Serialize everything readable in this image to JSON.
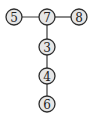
{
  "diagram": {
    "type": "tree",
    "nodes": [
      {
        "id": "5",
        "label": "5",
        "x": 14,
        "y": 17
      },
      {
        "id": "7",
        "label": "7",
        "x": 47,
        "y": 17
      },
      {
        "id": "8",
        "label": "8",
        "x": 79,
        "y": 17
      },
      {
        "id": "3",
        "label": "3",
        "x": 47,
        "y": 47
      },
      {
        "id": "4",
        "label": "4",
        "x": 47,
        "y": 76
      },
      {
        "id": "6",
        "label": "6",
        "x": 47,
        "y": 104
      }
    ],
    "edges": [
      {
        "from": "5",
        "to": "7"
      },
      {
        "from": "7",
        "to": "8"
      },
      {
        "from": "7",
        "to": "3"
      },
      {
        "from": "3",
        "to": "4"
      },
      {
        "from": "4",
        "to": "6"
      }
    ],
    "node_radius": 8,
    "colors": {
      "node_fill": "#e6e6e6",
      "node_stroke": "#2e2e2e",
      "edge": "#3a3a3a",
      "text": "#222222"
    }
  }
}
